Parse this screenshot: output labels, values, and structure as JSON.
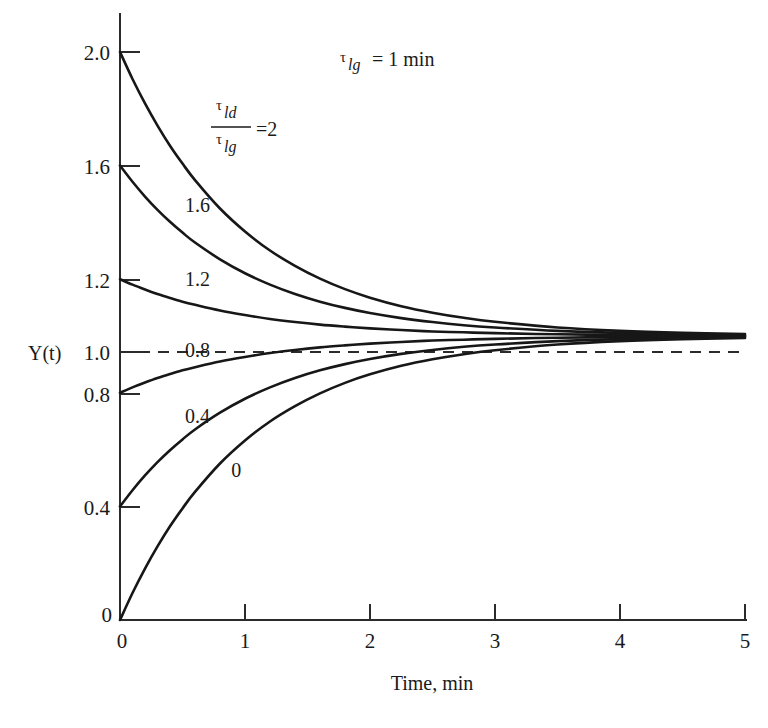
{
  "chart_data": {
    "type": "line",
    "title": "",
    "xlabel": "Time, min",
    "ylabel": "Y(t)",
    "xlim": [
      0,
      5
    ],
    "ylim": [
      0,
      2.0
    ],
    "grid": false,
    "legend_position": "inline-curve-labels",
    "x_ticks": [
      "0",
      "1",
      "2",
      "3",
      "4",
      "5"
    ],
    "x_tick_values": [
      0,
      1,
      2,
      3,
      4,
      5
    ],
    "y_ticks": [
      "0",
      "0.4",
      "0.8",
      "1.0",
      "1.2",
      "1.6",
      "2.0"
    ],
    "y_tick_values": [
      0,
      0.4,
      0.8,
      1.0,
      1.2,
      1.6,
      2.0
    ],
    "annotations": [
      {
        "name": "tau-lg-value",
        "text": "τ_lg = 1 min",
        "tau": "τ",
        "subscript": "lg",
        "equals": "= 1 min",
        "x": 2.1,
        "y": 1.87
      },
      {
        "name": "tau-ratio-equals-2",
        "numerator_tau": "τ",
        "numerator_sub": "ld",
        "denominator_tau": "τ",
        "denominator_sub": "lg",
        "equals": "=2",
        "x": 0.95,
        "y": 1.62
      }
    ],
    "asymptote": {
      "label": "steady-state",
      "value": 1.0,
      "style": "dashed"
    },
    "series": [
      {
        "name": "2",
        "label": "",
        "initial_value": 2.0,
        "final_value": 1.0,
        "x": [
          0,
          0.1,
          0.2,
          0.3,
          0.4,
          0.5,
          0.6,
          0.8,
          1.0,
          1.2,
          1.4,
          1.6,
          1.8,
          2.0,
          2.25,
          2.5,
          2.75,
          3.0,
          3.5,
          4.0,
          4.5,
          5.0
        ],
        "values": [
          2.0,
          1.905,
          1.819,
          1.741,
          1.67,
          1.607,
          1.549,
          1.449,
          1.368,
          1.301,
          1.247,
          1.202,
          1.165,
          1.135,
          1.105,
          1.082,
          1.064,
          1.05,
          1.03,
          1.018,
          1.011,
          1.007
        ]
      },
      {
        "name": "1.6",
        "label": "1.6",
        "label_x": 0.62,
        "label_y": 1.46,
        "initial_value": 1.6,
        "final_value": 1.0,
        "x": [
          0,
          0.1,
          0.2,
          0.3,
          0.4,
          0.5,
          0.6,
          0.8,
          1.0,
          1.2,
          1.4,
          1.6,
          1.8,
          2.0,
          2.25,
          2.5,
          2.75,
          3.0,
          3.5,
          4.0,
          4.5,
          5.0
        ],
        "values": [
          1.6,
          1.543,
          1.491,
          1.444,
          1.402,
          1.364,
          1.329,
          1.27,
          1.221,
          1.181,
          1.148,
          1.121,
          1.099,
          1.081,
          1.063,
          1.049,
          1.038,
          1.03,
          1.018,
          1.011,
          1.007,
          1.004
        ]
      },
      {
        "name": "1.2",
        "label": "1.2",
        "label_x": 0.62,
        "label_y": 1.2,
        "initial_value": 1.2,
        "final_value": 1.0,
        "x": [
          0,
          0.1,
          0.2,
          0.3,
          0.4,
          0.5,
          0.6,
          0.8,
          1.0,
          1.2,
          1.4,
          1.6,
          1.8,
          2.0,
          2.25,
          2.5,
          2.75,
          3.0,
          3.5,
          4.0,
          4.5,
          5.0
        ],
        "values": [
          1.2,
          1.181,
          1.164,
          1.148,
          1.134,
          1.121,
          1.11,
          1.09,
          1.074,
          1.06,
          1.049,
          1.04,
          1.033,
          1.027,
          1.021,
          1.016,
          1.013,
          1.01,
          1.006,
          1.004,
          1.002,
          1.001
        ]
      },
      {
        "name": "0.8",
        "label": "0.8",
        "label_x": 0.62,
        "label_y": 0.95,
        "initial_value": 0.8,
        "final_value": 1.0,
        "x": [
          0,
          0.1,
          0.2,
          0.3,
          0.4,
          0.5,
          0.6,
          0.8,
          1.0,
          1.2,
          1.4,
          1.6,
          1.8,
          2.0,
          2.25,
          2.5,
          2.75,
          3.0,
          3.5,
          4.0,
          4.5,
          5.0
        ],
        "values": [
          0.8,
          0.819,
          0.836,
          0.852,
          0.866,
          0.879,
          0.89,
          0.91,
          0.926,
          0.94,
          0.951,
          0.96,
          0.967,
          0.973,
          0.979,
          0.984,
          0.987,
          0.99,
          0.994,
          0.996,
          0.998,
          0.999
        ]
      },
      {
        "name": "0.4",
        "label": "0.4",
        "label_x": 0.62,
        "label_y": 0.72,
        "initial_value": 0.4,
        "final_value": 1.0,
        "x": [
          0,
          0.1,
          0.2,
          0.3,
          0.4,
          0.5,
          0.6,
          0.8,
          1.0,
          1.2,
          1.4,
          1.6,
          1.8,
          2.0,
          2.25,
          2.5,
          2.75,
          3.0,
          3.5,
          4.0,
          4.5,
          5.0
        ],
        "values": [
          0.4,
          0.457,
          0.509,
          0.556,
          0.598,
          0.636,
          0.671,
          0.73,
          0.779,
          0.819,
          0.852,
          0.879,
          0.901,
          0.919,
          0.937,
          0.951,
          0.962,
          0.97,
          0.982,
          0.989,
          0.993,
          0.996
        ]
      },
      {
        "name": "0",
        "label": "0",
        "label_x": 0.93,
        "label_y": 0.53,
        "initial_value": 0.0,
        "final_value": 1.0,
        "x": [
          0,
          0.1,
          0.2,
          0.3,
          0.4,
          0.5,
          0.6,
          0.8,
          1.0,
          1.2,
          1.4,
          1.6,
          1.8,
          2.0,
          2.25,
          2.5,
          2.75,
          3.0,
          3.5,
          4.0,
          4.5,
          5.0
        ],
        "values": [
          0.0,
          0.095,
          0.181,
          0.259,
          0.33,
          0.393,
          0.451,
          0.551,
          0.632,
          0.699,
          0.753,
          0.798,
          0.835,
          0.865,
          0.895,
          0.918,
          0.936,
          0.95,
          0.97,
          0.982,
          0.989,
          0.993
        ]
      }
    ]
  },
  "colors": {
    "curve": "#171717",
    "axis": "#2b2b2b",
    "background": "#ffffff"
  }
}
